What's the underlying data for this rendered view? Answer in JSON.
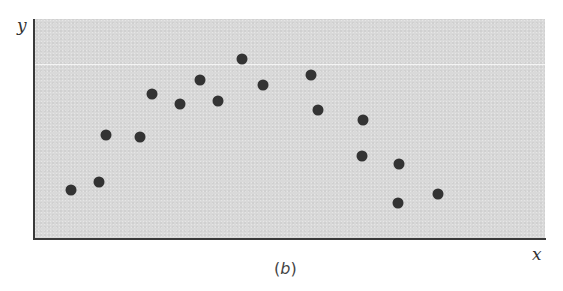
{
  "chart_data": {
    "type": "scatter",
    "title": "",
    "caption": "(b)",
    "xlabel": "x",
    "ylabel": "y",
    "grid": false,
    "ticks": "none",
    "reference_line": {
      "orientation": "horizontal",
      "y_px": 64,
      "color": "#f4f4f4"
    },
    "points_px": [
      {
        "x": 71,
        "y": 190
      },
      {
        "x": 99,
        "y": 182
      },
      {
        "x": 106,
        "y": 135
      },
      {
        "x": 140,
        "y": 137
      },
      {
        "x": 152,
        "y": 94
      },
      {
        "x": 180,
        "y": 104
      },
      {
        "x": 200,
        "y": 80
      },
      {
        "x": 218,
        "y": 101
      },
      {
        "x": 242,
        "y": 59
      },
      {
        "x": 263,
        "y": 85
      },
      {
        "x": 311,
        "y": 75
      },
      {
        "x": 318,
        "y": 110
      },
      {
        "x": 363,
        "y": 120
      },
      {
        "x": 362,
        "y": 156
      },
      {
        "x": 399,
        "y": 164
      },
      {
        "x": 398,
        "y": 203
      },
      {
        "x": 438,
        "y": 194
      }
    ],
    "points_relative": {
      "note": "x,y as fraction of plot area (0=left/bottom, 1=right/top)",
      "values": [
        [
          0.07,
          0.22
        ],
        [
          0.13,
          0.26
        ],
        [
          0.14,
          0.47
        ],
        [
          0.21,
          0.46
        ],
        [
          0.23,
          0.66
        ],
        [
          0.28,
          0.61
        ],
        [
          0.32,
          0.72
        ],
        [
          0.36,
          0.63
        ],
        [
          0.41,
          0.82
        ],
        [
          0.45,
          0.7
        ],
        [
          0.54,
          0.74
        ],
        [
          0.56,
          0.59
        ],
        [
          0.64,
          0.54
        ],
        [
          0.64,
          0.38
        ],
        [
          0.71,
          0.34
        ],
        [
          0.71,
          0.16
        ],
        [
          0.79,
          0.21
        ]
      ]
    },
    "colors": {
      "points": "#333333",
      "background": "#d9d9d9",
      "axes": "#3a3a3a"
    }
  },
  "labels": {
    "x": "x",
    "y": "y",
    "caption_open": "(",
    "caption_letter": "b",
    "caption_close": ")"
  }
}
